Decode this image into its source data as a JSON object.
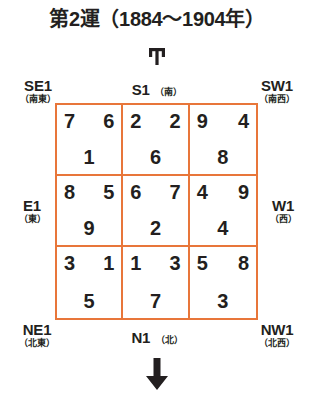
{
  "title": "第2運（1884〜1904年）",
  "colors": {
    "grid_border": "#e8763a",
    "text": "#231f20",
    "background": "#ffffff"
  },
  "markers": {
    "top_glyph_name": "up-arrow-glyph",
    "bottom_glyph_name": "down-arrow-glyph"
  },
  "directions": {
    "se": {
      "code": "SE1",
      "kanji": "（南東）"
    },
    "s": {
      "code": "S1",
      "kanji": "（南）"
    },
    "sw": {
      "code": "SW1",
      "kanji": "（南西）"
    },
    "e": {
      "code": "E1",
      "kanji": "（東）"
    },
    "w": {
      "code": "W1",
      "kanji": "（西）"
    },
    "ne": {
      "code": "NE1",
      "kanji": "（北東）"
    },
    "n": {
      "code": "N1",
      "kanji": "（北）"
    },
    "nw": {
      "code": "NW1",
      "kanji": "（北西）"
    }
  },
  "grid": {
    "rows": 3,
    "cols": 3,
    "cells": [
      {
        "position": "se-corner",
        "top_left": "7",
        "top_right": "6",
        "bottom": "1"
      },
      {
        "position": "s-middle",
        "top_left": "2",
        "top_right": "2",
        "bottom": "6"
      },
      {
        "position": "sw-corner",
        "top_left": "9",
        "top_right": "4",
        "bottom": "8"
      },
      {
        "position": "e-middle",
        "top_left": "8",
        "top_right": "5",
        "bottom": "9"
      },
      {
        "position": "center",
        "top_left": "6",
        "top_right": "7",
        "bottom": "2"
      },
      {
        "position": "w-middle",
        "top_left": "4",
        "top_right": "9",
        "bottom": "4"
      },
      {
        "position": "ne-corner",
        "top_left": "3",
        "top_right": "1",
        "bottom": "5"
      },
      {
        "position": "n-middle",
        "top_left": "1",
        "top_right": "3",
        "bottom": "7"
      },
      {
        "position": "nw-corner",
        "top_left": "5",
        "top_right": "8",
        "bottom": "3"
      }
    ]
  }
}
